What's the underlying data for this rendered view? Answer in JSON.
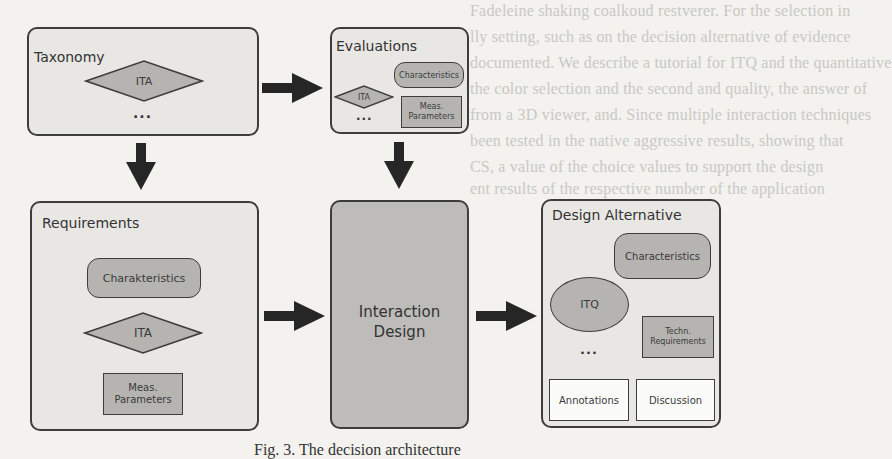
{
  "figure": {
    "caption": "Fig. 3. The decision architecture",
    "background_text": [
      "Fadeleine shaking coalkoud restverer. For the selection in",
      "lly setting, such as on the decision alternative of evidence",
      "documented. We describe a tutorial for ITQ and the quantitative",
      "the color selection and the second and quality, the answer of",
      "from a 3D viewer, and. Since multiple interaction techniques",
      "been tested in the native aggressive results, showing that",
      "CS, a value of the choice values to support the design",
      "ent results of the respective number of the application"
    ],
    "colors": {
      "page_bg": "#f3f2ef",
      "box_bg": "#e8e7e4",
      "box_dark_bg": "#bdbcb9",
      "shape_fill": "#b5b4b1",
      "border": "#3d3d3d",
      "arrow": "#262626"
    }
  },
  "nodes": {
    "taxonomy": {
      "title": "Taxonomy",
      "items": {
        "ita": "ITA",
        "more": "..."
      }
    },
    "evaluations": {
      "title": "Evaluations",
      "items": {
        "characteristics": "Characteristics",
        "ita": "ITA",
        "meas_params": "Meas. Parameters",
        "more": "..."
      }
    },
    "requirements": {
      "title": "Requirements",
      "items": {
        "characteristics": "Charakteristics",
        "ita": "ITA",
        "meas_params": "Meas. Parameters"
      }
    },
    "interaction_design": {
      "title_line1": "Interaction",
      "title_line2": "Design"
    },
    "design_alternative": {
      "title": "Design Alternative",
      "items": {
        "characteristics": "Characteristics",
        "itq": "ITQ",
        "techn_requirements": "Techn. Requirements",
        "more": "...",
        "annotations": "Annotations",
        "discussion": "Discussion"
      }
    }
  },
  "edges": [
    {
      "from": "Taxonomy",
      "to": "Evaluations",
      "direction": "right"
    },
    {
      "from": "Taxonomy",
      "to": "Requirements",
      "direction": "down"
    },
    {
      "from": "Evaluations",
      "to": "Interaction Design",
      "direction": "down"
    },
    {
      "from": "Requirements",
      "to": "Interaction Design",
      "direction": "right"
    },
    {
      "from": "Interaction Design",
      "to": "Design Alternative",
      "direction": "right"
    }
  ]
}
